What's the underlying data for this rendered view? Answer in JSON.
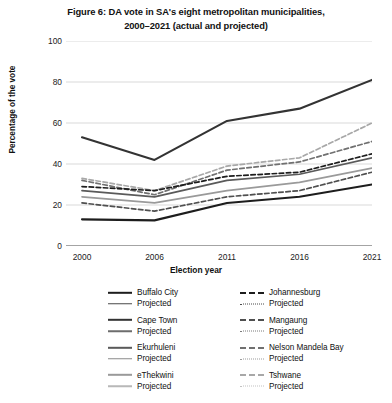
{
  "title": {
    "line1": "Figure 6: DA vote in SA's eight metropolitan municipalities,",
    "line2": "2000–2021 (actual and projected)"
  },
  "axes": {
    "ylabel": "Percentage of the vote",
    "xlabel": "Election year",
    "yticks": [
      "0",
      "20",
      "40",
      "60",
      "80",
      "100"
    ],
    "xticks": [
      "2000",
      "2006",
      "2011",
      "2016",
      "2021"
    ]
  },
  "legend": {
    "projected_label": "Projected",
    "left": [
      {
        "name": "Buffalo City",
        "color": "#1d1d1d",
        "projected_color": "#4a4a4a"
      },
      {
        "name": "Cape Town",
        "color": "#333333",
        "projected_color": "#6d6d6d"
      },
      {
        "name": "Ekurhuleni",
        "color": "#5a5a5a",
        "projected_color": "#8a8a8a"
      },
      {
        "name": "eThekwini",
        "color": "#9a9a9a",
        "projected_color": "#b8b8b8"
      }
    ],
    "right": [
      {
        "name": "Johannesburg",
        "color": "#1d1d1d",
        "projected_color": "#4a4a4a"
      },
      {
        "name": "Mangaung",
        "color": "#4f4f4f",
        "projected_color": "#7b7b7b"
      },
      {
        "name": "Nelson Mandela Bay",
        "color": "#707070",
        "projected_color": "#9c9c9c"
      },
      {
        "name": "Tshwane",
        "color": "#a8a8a8",
        "projected_color": "#c2c2c2"
      }
    ]
  },
  "chart_data": {
    "type": "line",
    "title": "Figure 6: DA vote in SA's eight metropolitan municipalities, 2000–2021 (actual and projected)",
    "xlabel": "Election year",
    "ylabel": "Percentage of the vote",
    "x": [
      2000,
      2006,
      2011,
      2016,
      2021
    ],
    "xtick_labels": [
      "2000",
      "2006",
      "2011",
      "2016",
      "2021"
    ],
    "ylim": [
      0,
      100
    ],
    "ytick_values": [
      0,
      20,
      40,
      60,
      80,
      100
    ],
    "grid": "horizontal",
    "legend_position": "below-plot",
    "series": [
      {
        "name": "Cape Town",
        "style": "solid",
        "color": "#333333",
        "values": [
          53,
          42,
          61,
          67,
          81
        ]
      },
      {
        "name": "Tshwane",
        "style": "dashed",
        "color": "#a8a8a8",
        "values": [
          33,
          27,
          39,
          43,
          60
        ]
      },
      {
        "name": "Nelson Mandela Bay",
        "style": "dashed",
        "color": "#707070",
        "values": [
          32,
          25,
          37,
          41,
          51
        ]
      },
      {
        "name": "Johannesburg",
        "style": "dashed",
        "color": "#1d1d1d",
        "values": [
          29,
          27,
          34,
          36,
          45
        ]
      },
      {
        "name": "Ekurhuleni",
        "style": "solid",
        "color": "#5a5a5a",
        "values": [
          27,
          24,
          32,
          35,
          43
        ]
      },
      {
        "name": "eThekwini",
        "style": "solid",
        "color": "#9a9a9a",
        "values": [
          24,
          21,
          27,
          31,
          38
        ]
      },
      {
        "name": "Mangaung",
        "style": "dashed",
        "color": "#4f4f4f",
        "values": [
          21,
          17,
          24,
          27,
          36
        ]
      },
      {
        "name": "Buffalo City",
        "style": "solid",
        "color": "#1d1d1d",
        "values": [
          13,
          12.5,
          21,
          24,
          30
        ]
      }
    ]
  }
}
